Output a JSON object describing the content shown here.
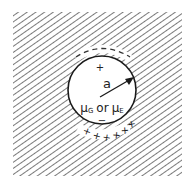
{
  "diagram": {
    "radius_label": "a",
    "inner_label": "μG or μE",
    "inner_label_parts": {
      "mu1": "μ",
      "sub1": "G",
      "or": "or",
      "mu2": "μ",
      "sub2": "E"
    },
    "top_inner_charge": "+",
    "bottom_inner_charge": "−",
    "top_outer_charges": "– – – – –",
    "bottom_outer_charges": "+ + + + + +",
    "colors": {
      "hatch": "#555555",
      "outline": "#1a1a1a",
      "background": "#ffffff"
    }
  }
}
